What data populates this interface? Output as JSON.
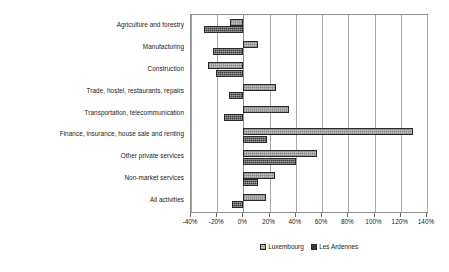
{
  "chart_data": {
    "type": "bar",
    "orientation": "horizontal",
    "title": "",
    "subtitle": "",
    "xlabel": "",
    "ylabel": "",
    "xlim": [
      -40,
      140
    ],
    "xtick_labels": [
      "-40%",
      "-20%",
      "0%",
      "20%",
      "40%",
      "60%",
      "80%",
      "100%",
      "120%",
      "140%"
    ],
    "xticks": [
      -40,
      -20,
      0,
      20,
      40,
      60,
      80,
      100,
      120,
      140
    ],
    "grid": true,
    "legend_position": "bottom-center",
    "categories": [
      "Agriculture and forestry",
      "Manufacturing",
      "Construction",
      "Trade, hostel, restaurants, repairs",
      "Transportation, telecommunication",
      "Finance, insurance, house sale and renting",
      "Other private services",
      "Non-market services",
      "All activities"
    ],
    "series": [
      {
        "name": "Luxembourg",
        "color": "#c9c9c9",
        "values": [
          -10,
          11,
          -27,
          25,
          35,
          129,
          56,
          24,
          17
        ]
      },
      {
        "name": "Les Ardennes",
        "color": "#3b3b3b",
        "values": [
          -30,
          -23,
          -21,
          -11,
          -15,
          18,
          40,
          11,
          -9
        ]
      }
    ]
  },
  "legend": {
    "items": [
      {
        "label": "Luxembourg",
        "swatch": "legend-swatch-luxembourg"
      },
      {
        "label": "Les Ardennes",
        "swatch": "legend-swatch-les-ardennes"
      }
    ]
  }
}
